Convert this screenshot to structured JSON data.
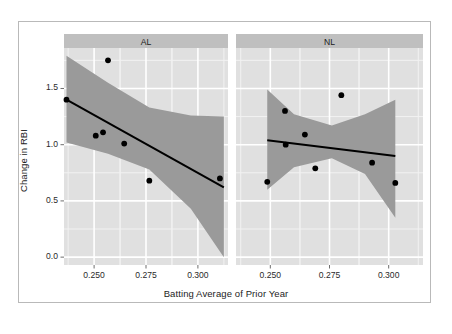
{
  "figure": {
    "background_color": "#ffffff",
    "frame_border_color": "#b9b9b9",
    "panel_background_color": "#e0e0e0",
    "panel_gridline_major_color": "#ffffff",
    "panel_gridline_minor_color": "#f2f2f2",
    "strip_background_color": "#bfbfbf",
    "ribbon_color": "#9a9a9a",
    "line_color": "#000000",
    "point_color": "#000000"
  },
  "axes": {
    "x_title": "Batting Average of Prior Year",
    "y_title": "Change in RBI",
    "x_ticks": [
      "0.250",
      "0.275",
      "0.300"
    ],
    "x_tick_values": [
      0.25,
      0.275,
      0.3
    ],
    "y_ticks": [
      "0.0",
      "0.5",
      "1.0",
      "1.5"
    ],
    "y_tick_values": [
      0.0,
      0.5,
      1.0,
      1.5
    ],
    "x_range": [
      0.2355,
      0.3145
    ],
    "y_range": [
      -0.07,
      1.86
    ]
  },
  "facets": [
    {
      "key": "AL",
      "label": "AL"
    },
    {
      "key": "NL",
      "label": "NL"
    }
  ],
  "chart_data": {
    "type": "scatter",
    "title": "",
    "subtitle": "",
    "xlabel": "Batting Average of Prior Year",
    "ylabel": "Change in RBI",
    "xlim": [
      0.2355,
      0.3145
    ],
    "ylim": [
      -0.07,
      1.86
    ],
    "grid": true,
    "legend_position": "none",
    "facet_variable": "League",
    "facet_labels": [
      "AL",
      "NL"
    ],
    "annotations": [],
    "panels": [
      {
        "facet": "AL",
        "points": [
          {
            "x": 0.2367,
            "y": 1.4
          },
          {
            "x": 0.2567,
            "y": 1.75
          },
          {
            "x": 0.2508,
            "y": 1.08
          },
          {
            "x": 0.2543,
            "y": 1.11
          },
          {
            "x": 0.2645,
            "y": 1.01
          },
          {
            "x": 0.2766,
            "y": 0.68
          },
          {
            "x": 0.3106,
            "y": 0.7
          }
        ],
        "fit_line": {
          "type": "linear",
          "x_start": 0.2367,
          "y_start": 1.4,
          "x_end": 0.3125,
          "y_end": 0.62
        },
        "confidence_band": {
          "level": 0.95,
          "x": [
            0.2367,
            0.2567,
            0.2766,
            0.2966,
            0.3125
          ],
          "upper": [
            1.79,
            1.55,
            1.33,
            1.26,
            1.25
          ],
          "lower": [
            1.02,
            0.92,
            0.78,
            0.43,
            0.0
          ]
        }
      },
      {
        "facet": "NL",
        "points": [
          {
            "x": 0.2487,
            "y": 0.67
          },
          {
            "x": 0.2562,
            "y": 1.3
          },
          {
            "x": 0.2565,
            "y": 1.0
          },
          {
            "x": 0.2646,
            "y": 1.09
          },
          {
            "x": 0.269,
            "y": 0.79
          },
          {
            "x": 0.28,
            "y": 1.44
          },
          {
            "x": 0.293,
            "y": 0.84
          },
          {
            "x": 0.3028,
            "y": 0.66
          }
        ],
        "fit_line": {
          "type": "linear",
          "x_start": 0.2487,
          "y_start": 1.04,
          "x_end": 0.3028,
          "y_end": 0.9
        },
        "confidence_band": {
          "level": 0.95,
          "x": [
            0.2487,
            0.26,
            0.276,
            0.29,
            0.3028
          ],
          "upper": [
            1.49,
            1.27,
            1.17,
            1.27,
            1.4
          ],
          "lower": [
            0.6,
            0.8,
            0.88,
            0.74,
            0.35
          ]
        }
      }
    ]
  }
}
